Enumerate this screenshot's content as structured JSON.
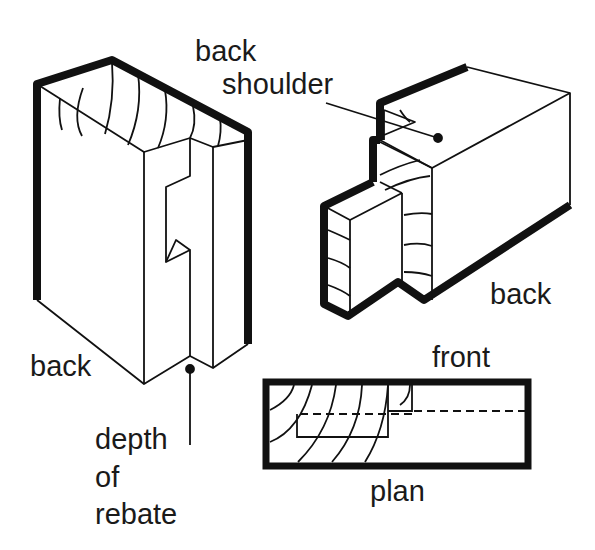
{
  "diagram": {
    "colors": {
      "ink": "#111111",
      "paper": "#ffffff"
    },
    "labels": {
      "back_shoulder_line1": "back",
      "back_shoulder_line2": "shoulder",
      "back_right": "back",
      "back_left": "back",
      "front": "front",
      "plan": "plan",
      "depth_line1": "depth",
      "depth_line2": "of",
      "depth_line3": "rebate"
    },
    "figures": [
      {
        "name": "rebated-post",
        "description": "Post with rebate cut, isometric view"
      },
      {
        "name": "tenon-piece",
        "description": "Piece with tenon and back shoulder, isometric view"
      },
      {
        "name": "plan-view",
        "description": "Plan view of joint with hidden lines"
      }
    ]
  }
}
